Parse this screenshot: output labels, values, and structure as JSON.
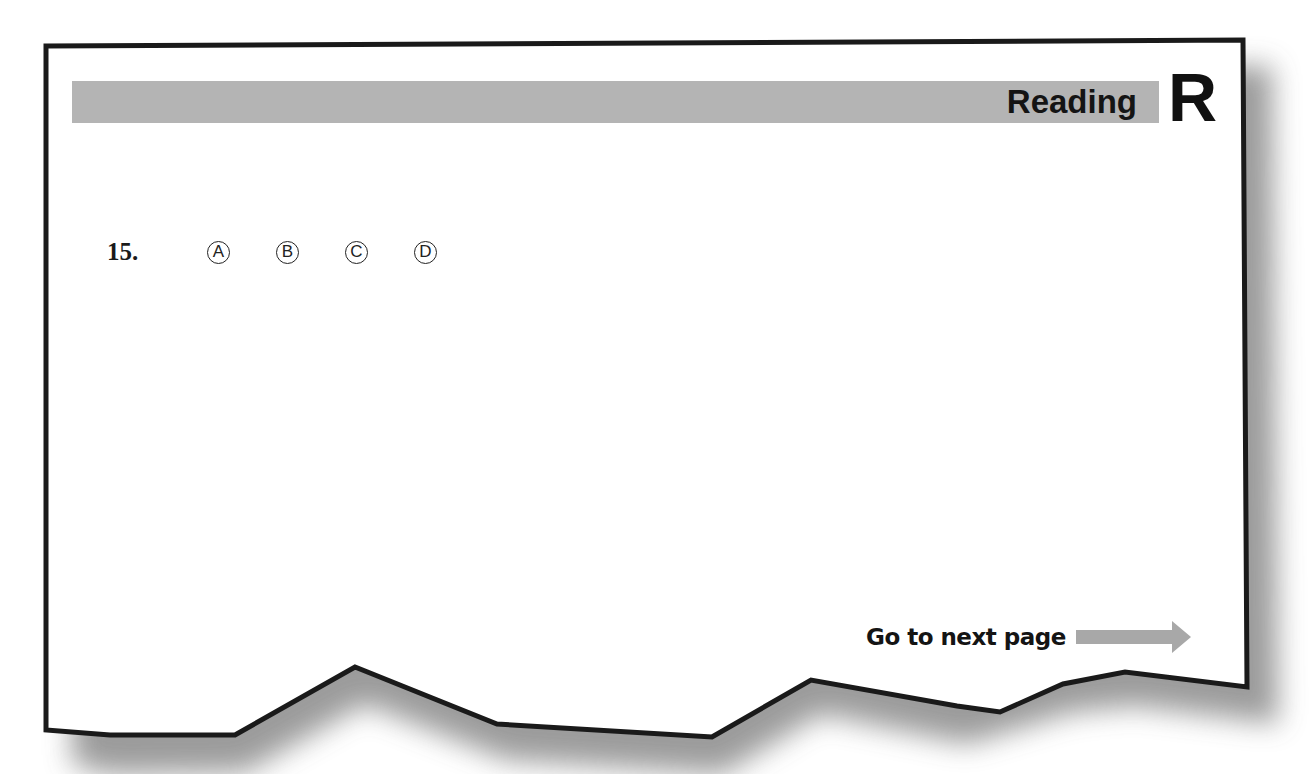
{
  "header": {
    "section_title": "Reading",
    "section_letter": "R",
    "bar_color": "#b4b4b4"
  },
  "question": {
    "number": "15.",
    "options": [
      {
        "letter": "A",
        "glyph": "A"
      },
      {
        "letter": "B",
        "glyph": "B"
      },
      {
        "letter": "C",
        "glyph": "C"
      },
      {
        "letter": "D",
        "glyph": "D"
      }
    ]
  },
  "footer": {
    "next_label": "Go to next page",
    "arrow_icon": "right-arrow-icon",
    "arrow_color": "#a8a8a8"
  }
}
